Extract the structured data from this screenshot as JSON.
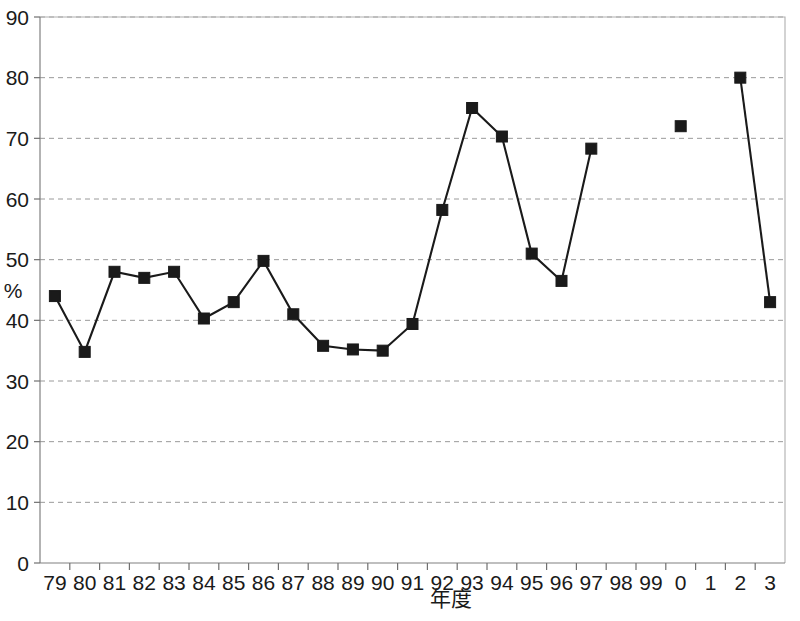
{
  "chart_data": {
    "type": "line",
    "title": "",
    "subtitle": "",
    "xlabel": "年度",
    "ylabel": "%",
    "categories": [
      "79",
      "80",
      "81",
      "82",
      "83",
      "84",
      "85",
      "86",
      "87",
      "88",
      "89",
      "90",
      "91",
      "92",
      "93",
      "94",
      "95",
      "96",
      "97",
      "98",
      "99",
      "0",
      "1",
      "2",
      "3"
    ],
    "values": [
      44,
      34.8,
      48,
      47,
      48,
      40.3,
      43,
      49.8,
      41,
      35.8,
      35.2,
      35,
      39.4,
      58.2,
      75,
      70.3,
      51,
      46.5,
      68.3,
      null,
      null,
      72,
      null,
      80,
      43
    ],
    "series": [
      {
        "name": "series-1",
        "values": [
          44,
          34.8,
          48,
          47,
          48,
          40.3,
          43,
          49.8,
          41,
          35.8,
          35.2,
          35,
          39.4,
          58.2,
          75,
          70.3,
          51,
          46.5,
          68.3,
          null,
          null,
          72,
          null,
          80,
          43
        ]
      }
    ],
    "ylim": [
      0,
      90
    ],
    "yticks": [
      0,
      10,
      20,
      30,
      40,
      50,
      60,
      70,
      80,
      90
    ],
    "ytick_labels": [
      "0",
      "10",
      "20",
      "30",
      "40",
      "50",
      "60",
      "70",
      "80",
      "90"
    ],
    "xtick_labels": [
      "79",
      "80",
      "81",
      "82",
      "83",
      "84",
      "85",
      "86",
      "87",
      "88",
      "89",
      "90",
      "91",
      "92",
      "93",
      "94",
      "95",
      "96",
      "97",
      "98",
      "99",
      "0",
      "1",
      "2",
      "3"
    ],
    "grid": true,
    "grid_axis": "y",
    "legend": null,
    "legend_position": "none",
    "marker": "square",
    "marker_color": "#1a1a1a",
    "line_color": "#1a1a1a",
    "grid_color": "#9a9a9a",
    "axis_color": "#808080",
    "background": "#ffffff",
    "annotations": []
  },
  "layout": {
    "plot_left": 40,
    "plot_right": 785,
    "plot_top": 17,
    "plot_bottom": 563,
    "xlabel_y": 606,
    "ylabel_x": 13,
    "ylabel_y": 298
  }
}
